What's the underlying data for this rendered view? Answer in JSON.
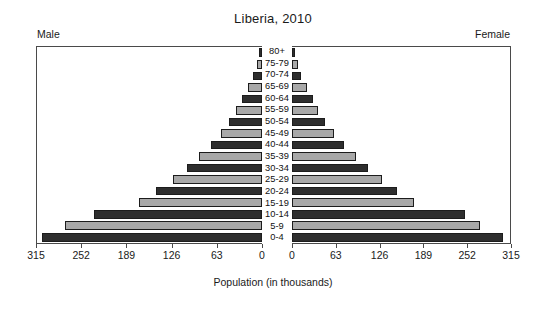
{
  "chart_data": {
    "type": "bar",
    "subtype": "population-pyramid",
    "title": "Liberia, 2010",
    "xlabel": "Population (in thousands)",
    "ylabel": "",
    "grid": false,
    "legend_position": "top",
    "xlim": [
      0,
      315
    ],
    "xticks": [
      0,
      63,
      126,
      189,
      252,
      315
    ],
    "left_axis_ticks": [
      "315",
      "252",
      "189",
      "126",
      "63",
      "0"
    ],
    "right_axis_ticks": [
      "0",
      "63",
      "126",
      "189",
      "252",
      "315"
    ],
    "left_label": "Male",
    "right_label": "Female",
    "categories": [
      "80+",
      "75-79",
      "70-74",
      "65-69",
      "60-64",
      "55-59",
      "50-54",
      "45-49",
      "40-44",
      "35-39",
      "30-34",
      "25-29",
      "20-24",
      "15-19",
      "10-14",
      "5-9",
      "0-4"
    ],
    "series": [
      {
        "name": "Male",
        "side": "left",
        "values": [
          4,
          7,
          12,
          20,
          28,
          36,
          46,
          58,
          72,
          88,
          105,
          125,
          148,
          172,
          235,
          276,
          308
        ]
      },
      {
        "name": "Female",
        "side": "right",
        "values": [
          5,
          8,
          13,
          21,
          30,
          38,
          48,
          60,
          75,
          92,
          110,
          130,
          152,
          176,
          250,
          272,
          305
        ]
      }
    ],
    "bar_colors": {
      "dark": "#2e2e2e",
      "light": "#a8a8a8",
      "border": "#1c1c1c"
    },
    "axis_color": "#4a4a4a"
  }
}
